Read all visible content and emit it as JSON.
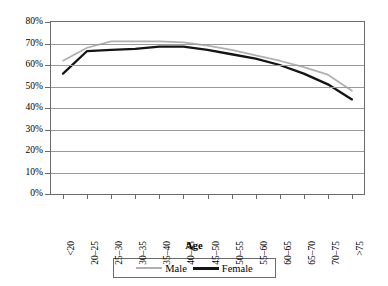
{
  "chart_data": {
    "type": "line",
    "title": "",
    "xlabel": "Age",
    "ylabel": "",
    "ylim": [
      0,
      80
    ],
    "grid": true,
    "legend_position": "bottom",
    "categories": [
      "<20",
      "20–25",
      "25–30",
      "30–35",
      "35–40",
      "40–45",
      "45–50",
      "50–55",
      "55–60",
      "60–65",
      "65–70",
      "70–75",
      ">75"
    ],
    "ytick_labels": [
      "0%",
      "10%",
      "20%",
      "30%",
      "40%",
      "50%",
      "60%",
      "70%",
      "80%"
    ],
    "ytick_values": [
      0,
      10,
      20,
      30,
      40,
      50,
      60,
      70,
      80
    ],
    "series": [
      {
        "name": "Male",
        "color": "#b0b0b0",
        "values": [
          62.0,
          68.0,
          71.0,
          71.0,
          71.0,
          70.5,
          69.0,
          67.0,
          64.5,
          62.0,
          59.0,
          55.5,
          48.0
        ]
      },
      {
        "name": "Female",
        "color": "#141414",
        "values": [
          56.0,
          66.5,
          67.0,
          67.5,
          68.5,
          68.5,
          67.0,
          65.0,
          63.0,
          60.0,
          56.0,
          51.0,
          44.0
        ]
      }
    ]
  },
  "legend": {
    "male_label": "Male",
    "female_label": "Female"
  },
  "axis": {
    "x_title": "Age"
  }
}
